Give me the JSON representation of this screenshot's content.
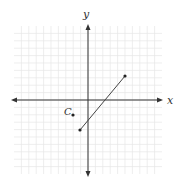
{
  "diagram": {
    "type": "coordinate-plane",
    "axes": {
      "x_label": "x",
      "y_label": "y"
    },
    "grid": {
      "visible": true,
      "color": "#e6e6e6",
      "spacing_px": 7.4
    },
    "colors": {
      "axis": "#333333",
      "segment": "#444444",
      "point": "#222222"
    },
    "segment": {
      "start_px": [
        80,
        130
      ],
      "end_px": [
        125,
        76
      ]
    },
    "point": {
      "label": "C",
      "position_px": [
        73,
        115
      ]
    }
  }
}
